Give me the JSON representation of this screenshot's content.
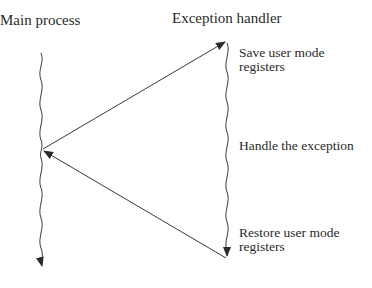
{
  "diagram": {
    "titles": {
      "main_process": "Main process",
      "exception_handler": "Exception handler"
    },
    "steps": [
      {
        "line1": "Save user mode",
        "line2": "registers"
      },
      {
        "line1": "Handle the exception"
      },
      {
        "line1": "Restore user mode",
        "line2": "registers"
      }
    ],
    "colors": {
      "line": "#3a3a3a",
      "text": "#2a2a2a",
      "background": "#ffffff"
    }
  }
}
